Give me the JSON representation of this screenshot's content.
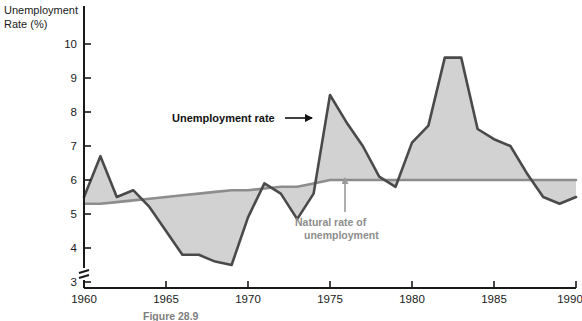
{
  "chart_data": {
    "type": "line",
    "title": "",
    "xlabel": "",
    "ylabel": "Unemployment Rate (%)",
    "ylabel_line1": "Unemployment",
    "ylabel_line2": "Rate (%)",
    "xlim": [
      1960,
      1990
    ],
    "ylim": [
      3,
      10
    ],
    "y_axis_break": true,
    "grid": false,
    "legend_position": "inline-annotations",
    "y_ticks": [
      3,
      4,
      5,
      6,
      7,
      8,
      9,
      10
    ],
    "x_ticks": [
      1960,
      1965,
      1970,
      1975,
      1980,
      1985,
      1990
    ],
    "x": [
      1960,
      1961,
      1962,
      1963,
      1964,
      1965,
      1966,
      1967,
      1968,
      1969,
      1970,
      1971,
      1972,
      1973,
      1974,
      1975,
      1976,
      1977,
      1978,
      1979,
      1980,
      1981,
      1982,
      1983,
      1984,
      1985,
      1986,
      1987,
      1988,
      1989,
      1990
    ],
    "series": [
      {
        "name": "Unemployment rate",
        "color": "#4a4a4a",
        "values": [
          5.5,
          6.7,
          5.5,
          5.7,
          5.2,
          4.5,
          3.8,
          3.8,
          3.6,
          3.5,
          4.9,
          5.9,
          5.6,
          4.85,
          5.6,
          8.5,
          7.7,
          7.0,
          6.1,
          5.8,
          7.1,
          7.6,
          9.6,
          9.6,
          7.5,
          7.2,
          7.0,
          6.2,
          5.5,
          5.3,
          5.5
        ]
      },
      {
        "name": "Natural rate of unemployment",
        "color": "#8d8d8d",
        "values": [
          5.3,
          5.3,
          5.35,
          5.4,
          5.45,
          5.5,
          5.55,
          5.6,
          5.65,
          5.7,
          5.7,
          5.75,
          5.8,
          5.8,
          5.9,
          6.0,
          6.0,
          6.0,
          6.0,
          6.0,
          6.0,
          6.0,
          6.0,
          6.0,
          6.0,
          6.0,
          6.0,
          6.0,
          6.0,
          6.0,
          6.0
        ]
      }
    ],
    "fill_color": "#d2d2d2",
    "annotations": [
      {
        "text": "Unemployment rate",
        "style": "dark",
        "arrow": "right"
      },
      {
        "text": "Natural rate of",
        "style": "gray",
        "arrow": "up"
      },
      {
        "text": "unemployment",
        "style": "gray",
        "arrow": "none"
      }
    ]
  },
  "caption": {
    "figure_label": "Figure 28.9"
  }
}
